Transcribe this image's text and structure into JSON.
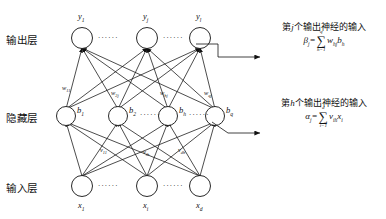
{
  "diagram": {
    "layers": [
      {
        "id": "output",
        "label": "输出层",
        "nodes": [
          {
            "label": "y",
            "sub": "1"
          },
          {
            "label": "y",
            "sub": "j"
          },
          {
            "label": "y",
            "sub": "l"
          }
        ]
      },
      {
        "id": "hidden",
        "label": "隐藏层",
        "nodes": [
          {
            "label": "b",
            "sub": "1"
          },
          {
            "label": "b",
            "sub": "2"
          },
          {
            "label": "b",
            "sub": "h"
          },
          {
            "label": "b",
            "sub": "q"
          }
        ]
      },
      {
        "id": "input",
        "label": "输入层",
        "nodes": [
          {
            "label": "x",
            "sub": "1"
          },
          {
            "label": "x",
            "sub": "i"
          },
          {
            "label": "x",
            "sub": "d"
          }
        ]
      }
    ],
    "ellipsis": "······",
    "weights_hidden_output": [
      {
        "label": "w",
        "sub": "11"
      },
      {
        "label": "w",
        "sub": "2j"
      },
      {
        "label": "w",
        "sub": "hj"
      },
      {
        "label": "w",
        "sub": "qj"
      }
    ],
    "weights_input_hidden": [
      {
        "label": "v",
        "sub": "11"
      },
      {
        "label": "v",
        "sub": "ih"
      },
      {
        "label": "v",
        "sub": "dh"
      }
    ],
    "annotations": [
      {
        "id": "beta",
        "text_prefix": "第",
        "text_var": "j",
        "text_suffix": "个输出神经的输入",
        "lhs": "β",
        "lhs_sub": "j",
        "eq": "=",
        "sum_top": "q",
        "sum_bottom": "h=1",
        "term": "w",
        "term_sub": "hj",
        "term2": "b",
        "term2_sub": "h"
      },
      {
        "id": "alpha",
        "text_prefix": "第",
        "text_var": "h",
        "text_suffix": "个输出神经的输入",
        "lhs": "α",
        "lhs_sub": "j",
        "eq": "=",
        "sum_top": "d",
        "sum_bottom": "i=1",
        "term": "v",
        "term_sub": "ih",
        "term2": "x",
        "term2_sub": "i"
      }
    ],
    "colors": {
      "stroke": "#111111",
      "background": "#ffffff",
      "text": "#111111"
    }
  }
}
